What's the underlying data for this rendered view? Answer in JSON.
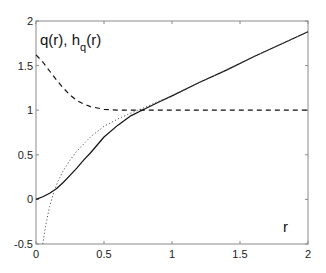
{
  "chart_data": {
    "type": "line",
    "title": "",
    "xlabel": "r",
    "ylabel": "q(r), h_q(r)",
    "xlim": [
      0,
      2
    ],
    "ylim": [
      -0.5,
      2
    ],
    "grid": false,
    "legend": null,
    "x_ticks": [
      0,
      0.5,
      1,
      1.5,
      2
    ],
    "x_tick_labels": [
      "0",
      "0.5",
      "1",
      "1.5",
      "2"
    ],
    "y_ticks": [
      -0.5,
      0,
      0.5,
      1,
      1.5,
      2
    ],
    "y_tick_labels": [
      "-0.5",
      "0",
      "0.5",
      "1",
      "1.5",
      "2"
    ],
    "annotations": [
      {
        "text": "q(r), h",
        "subscript": "q",
        "suffix": "(r)",
        "x": 0.02,
        "y": 1.72
      },
      {
        "text": "r",
        "x": 1.82,
        "y": -0.35
      }
    ],
    "series": [
      {
        "name": "solid",
        "style": "solid",
        "color": "#111111",
        "x": [
          0,
          0.05,
          0.1,
          0.15,
          0.2,
          0.25,
          0.3,
          0.35,
          0.4,
          0.5,
          0.6,
          0.7,
          0.78,
          0.9,
          1.0,
          1.2,
          1.4,
          1.6,
          1.8,
          2.0
        ],
        "y": [
          0,
          0.03,
          0.07,
          0.12,
          0.19,
          0.27,
          0.35,
          0.44,
          0.52,
          0.7,
          0.83,
          0.94,
          1.0,
          1.09,
          1.16,
          1.31,
          1.45,
          1.6,
          1.74,
          1.88
        ]
      },
      {
        "name": "dotted",
        "style": "dotted",
        "color": "#555555",
        "x": [
          0.05,
          0.07,
          0.1,
          0.13,
          0.16,
          0.2,
          0.25,
          0.3,
          0.4,
          0.5,
          0.6,
          0.7,
          0.8,
          0.9,
          1.0,
          1.2,
          1.4,
          1.6,
          1.8,
          2.0
        ],
        "y": [
          -0.5,
          -0.3,
          -0.08,
          0.08,
          0.2,
          0.32,
          0.44,
          0.54,
          0.7,
          0.82,
          0.9,
          0.97,
          1.03,
          1.1,
          1.16,
          1.31,
          1.45,
          1.6,
          1.74,
          1.88
        ]
      },
      {
        "name": "dashed",
        "style": "dashed",
        "color": "#111111",
        "x": [
          0,
          0.05,
          0.1,
          0.15,
          0.2,
          0.25,
          0.3,
          0.35,
          0.4,
          0.5,
          0.6,
          0.7,
          0.8,
          1.0,
          1.5,
          2.0
        ],
        "y": [
          1.62,
          1.54,
          1.44,
          1.34,
          1.25,
          1.17,
          1.11,
          1.07,
          1.04,
          1.01,
          1.0,
          1.0,
          1.0,
          1.0,
          1.0,
          1.0
        ]
      }
    ]
  },
  "labels": {
    "y_annotation_main": "q(r), h",
    "y_annotation_sub": "q",
    "y_annotation_suffix": "(r)",
    "x_annotation": "r"
  }
}
